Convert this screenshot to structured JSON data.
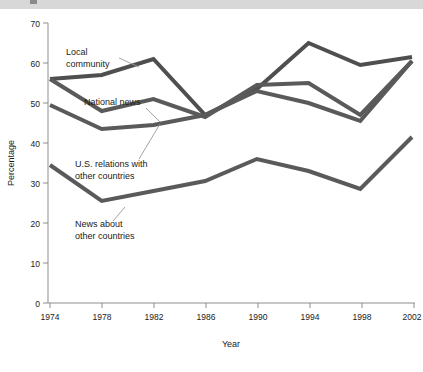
{
  "banner": {
    "present": true,
    "color": "#d8d8d8"
  },
  "chart_data": {
    "type": "line",
    "title": "",
    "subtitle": "",
    "xlabel": "Year",
    "ylabel": "Percentage",
    "categories": [
      "1974",
      "1978",
      "1982",
      "1986",
      "1990",
      "1994",
      "1998",
      "2002"
    ],
    "x": [
      1974,
      1978,
      1982,
      1986,
      1990,
      1994,
      1998,
      2002
    ],
    "xlim": [
      1974,
      2002
    ],
    "ylim": [
      0,
      70
    ],
    "yticks": [
      0,
      10,
      20,
      30,
      40,
      50,
      60,
      70
    ],
    "ytick_labels": [
      "0",
      "10",
      "20",
      "30",
      "40",
      "50",
      "60",
      "70"
    ],
    "xtick_labels": [
      "1974",
      "1978",
      "1982",
      "1986",
      "1990",
      "1994",
      "1998",
      "2002"
    ],
    "grid": false,
    "legend_position": "inline-annotations",
    "line_color": "#555555",
    "line_width": 4,
    "series": [
      {
        "name": "Local community",
        "color": "#4f4f4f",
        "values": [
          56,
          57,
          61,
          47,
          53.5,
          65,
          59.5,
          61.5
        ]
      },
      {
        "name": "National news",
        "color": "#5a5a5a",
        "values": [
          56,
          48,
          51,
          46.5,
          54.5,
          55,
          47,
          60.5
        ]
      },
      {
        "name": "U.S. relations with other countries",
        "color": "#5a5a5a",
        "values": [
          49.5,
          43.5,
          44.5,
          47,
          53,
          50,
          45.5,
          60.5
        ]
      },
      {
        "name": "News about other countries",
        "color": "#5a5a5a",
        "values": [
          34.5,
          25.5,
          28,
          30.5,
          36,
          33,
          28.5,
          41.5
        ]
      }
    ],
    "annotations": [
      {
        "id": "local-community",
        "label_line1": "Local",
        "label_line2": "community",
        "text_x": 66,
        "text_y": 46,
        "leader": {
          "x1": 119,
          "y1": 49,
          "x2": 139,
          "y2": 58
        }
      },
      {
        "id": "national-news",
        "label_line1": "National news",
        "label_line2": "",
        "text_x": 84,
        "text_y": 96,
        "leader": {
          "x1": 146,
          "y1": 99,
          "x2": 160,
          "y2": 113
        }
      },
      {
        "id": "us-relations",
        "label_line1": "U.S. relations with",
        "label_line2": "other countries",
        "text_x": 75,
        "text_y": 158,
        "leader": {
          "x1": 139,
          "y1": 150,
          "x2": 160,
          "y2": 115
        }
      },
      {
        "id": "news-about-other-countries",
        "label_line1": "News about",
        "label_line2": "other countries",
        "text_x": 75,
        "text_y": 218,
        "leader": {
          "x1": 113,
          "y1": 212,
          "x2": 125,
          "y2": 198
        }
      }
    ]
  }
}
